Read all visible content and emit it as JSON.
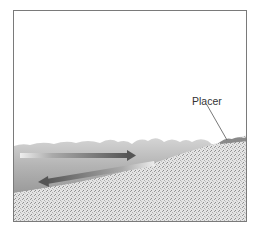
{
  "figure": {
    "labels": {
      "placer": "Placer"
    },
    "elements": {
      "water": "shallow water with wave surface",
      "seafloor": "sloping sand/gravel beach",
      "arrow_onshore": "wave swash arrow pointing right (toward shore)",
      "arrow_offshore": "backwash arrow pointing left (seaward)",
      "placer_deposit": "placer deposit at shoreline"
    },
    "colors": {
      "frame": "#7a7a7a",
      "water": "#b9b9b9",
      "sand": "#d8d8d8",
      "arrow": "#555555",
      "leader_line": "#555555"
    }
  }
}
